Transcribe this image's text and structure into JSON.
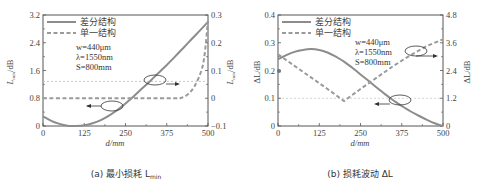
{
  "chart_data": [
    {
      "type": "line",
      "panel": "a",
      "caption": "(a) 最小损耗 L",
      "caption_sub": "min",
      "xlabel": "d/mm",
      "ylabel_left": "L/dB",
      "ylabel_left_sub": "min",
      "ylabel_right": "L/dB",
      "ylabel_right_sub": "min",
      "xlim": [
        0,
        500
      ],
      "ylim_left": [
        0,
        3.2
      ],
      "ylim_right": [
        -0.1,
        0.3
      ],
      "xticks": [
        "0",
        "125",
        "250",
        "375",
        "500"
      ],
      "yticks_left": [
        "0",
        "0.8",
        "1.6",
        "2.4",
        "3.2"
      ],
      "yticks_right": [
        "-0.1",
        "0",
        "0.1",
        "0.2",
        "0.3"
      ],
      "legend": [
        "差分结构",
        "单一结构"
      ],
      "annotations": [
        "w=440μm",
        "λ=1550nm",
        "S=800mm"
      ],
      "series": [
        {
          "name": "差分结构",
          "axis": "left",
          "style": "solid",
          "x": [
            0,
            25,
            50,
            75,
            100,
            125,
            150,
            175,
            200,
            225,
            250,
            275,
            300,
            325,
            350,
            375,
            400,
            425,
            450,
            475,
            500
          ],
          "y": [
            0.28,
            0.15,
            0.06,
            0.01,
            0.0,
            0.02,
            0.08,
            0.17,
            0.3,
            0.46,
            0.65,
            0.86,
            1.08,
            1.3,
            1.53,
            1.76,
            2.0,
            2.25,
            2.5,
            2.75,
            3.0
          ]
        },
        {
          "name": "单一结构",
          "axis": "right",
          "style": "dashed",
          "x": [
            0,
            100,
            200,
            300,
            400,
            420,
            440,
            460,
            480,
            490,
            500
          ],
          "y": [
            0,
            0,
            0,
            0,
            0,
            0.002,
            0.015,
            0.045,
            0.1,
            0.16,
            0.28
          ]
        }
      ]
    },
    {
      "type": "line",
      "panel": "b",
      "caption": "(b) 损耗波动 ΔL",
      "xlabel": "d/mm",
      "ylabel_left": "ΔL/dB",
      "ylabel_right": "ΔL/dB",
      "xlim": [
        0,
        500
      ],
      "ylim_left": [
        0,
        0.4
      ],
      "ylim_right": [
        0,
        4.8
      ],
      "xticks": [
        "0",
        "125",
        "250",
        "375",
        "500"
      ],
      "yticks_left": [
        "0",
        "0.1",
        "0.2",
        "0.3",
        "0.4"
      ],
      "yticks_right": [
        "0",
        "1.2",
        "2.4",
        "3.6",
        "4.8"
      ],
      "legend": [
        "差分结构",
        "单一结构"
      ],
      "annotations": [
        "w=440μm",
        "λ=1550nm",
        "S=800mm"
      ],
      "series": [
        {
          "name": "差分结构",
          "axis": "left",
          "style": "solid",
          "x": [
            0,
            25,
            50,
            75,
            100,
            125,
            150,
            175,
            200,
            225,
            250,
            275,
            300,
            325,
            350,
            375,
            400,
            425,
            450,
            475,
            500
          ],
          "y": [
            0.24,
            0.255,
            0.267,
            0.274,
            0.277,
            0.274,
            0.265,
            0.25,
            0.232,
            0.21,
            0.186,
            0.162,
            0.138,
            0.114,
            0.092,
            0.072,
            0.054,
            0.038,
            0.023,
            0.01,
            0.0
          ]
        },
        {
          "name": "单一结构",
          "axis": "right",
          "style": "dashed",
          "x": [
            0,
            50,
            100,
            150,
            200,
            250,
            300,
            350,
            400,
            450,
            500
          ],
          "y": [
            3.1,
            2.6,
            2.1,
            1.6,
            1.08,
            1.6,
            2.1,
            2.6,
            3.05,
            3.45,
            3.75
          ]
        }
      ]
    }
  ],
  "colors": {
    "solid_line": "#8c8c8c",
    "dashed_line": "#9a9a9a",
    "axis": "#555555",
    "reference_dotted": "#c8c8c8"
  }
}
